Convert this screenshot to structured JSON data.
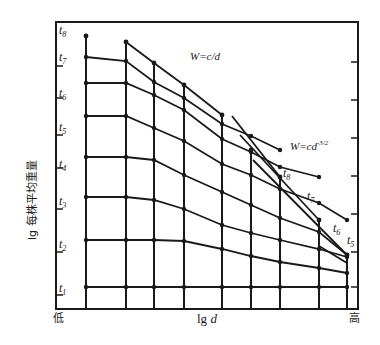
{
  "chart_data": {
    "type": "line",
    "title": "",
    "xlabel": "lg d",
    "ylabel": "lg 每株平均重量",
    "x_axis_ends": {
      "low": "低",
      "high": "高"
    },
    "grid": false,
    "legend": null,
    "annotations": [
      {
        "text": "W=c/d",
        "position": "upper-middle"
      },
      {
        "text": "W=cd^-3/2",
        "display_base": "W=cd",
        "display_exp": "-3/2",
        "position": "right-middle"
      }
    ],
    "y_tick_labels": [
      "t1",
      "t2",
      "t3",
      "t4",
      "t5",
      "t6",
      "t7",
      "t8"
    ],
    "density_positions_px": [
      86,
      126,
      154,
      184,
      222,
      251,
      280,
      319,
      347
    ],
    "density_column_tops_px": [
      36,
      42,
      63,
      85,
      115,
      150,
      177,
      220,
      255
    ],
    "series": [
      {
        "name": "t1",
        "values_px": [
          287,
          287,
          287,
          287,
          287,
          287,
          287,
          287,
          287
        ]
      },
      {
        "name": "t2",
        "values_px": [
          240,
          240,
          240,
          241,
          249,
          256,
          262,
          268,
          273
        ]
      },
      {
        "name": "t3",
        "values_px": [
          197,
          197,
          200,
          209,
          225,
          233,
          240,
          249,
          257
        ]
      },
      {
        "name": "t4",
        "values_px": [
          157,
          157,
          160,
          175,
          192,
          205,
          218,
          232,
          255
        ]
      },
      {
        "name": "t5",
        "values_px": [
          116,
          116,
          128,
          141,
          164,
          175,
          189,
          203,
          220
        ]
      },
      {
        "name": "t6",
        "values_px": [
          83,
          83,
          95,
          110,
          139,
          152,
          167,
          177
        ]
      },
      {
        "name": "t7",
        "values_px": [
          57,
          61,
          82,
          98,
          124,
          136,
          150
        ]
      },
      {
        "name": "t8",
        "values_px": [
          36
        ]
      }
    ],
    "envelope_wcd": {
      "x_px": [
        126,
        154,
        184,
        222
      ],
      "y_px": [
        42,
        63,
        85,
        115
      ]
    },
    "self_thinning_lines": [
      {
        "label": "t8",
        "x1": 232,
        "y1": 116,
        "x2": 280,
        "y2": 177
      },
      {
        "label": "t7",
        "x1": 240,
        "y1": 135,
        "x2": 319,
        "y2": 220
      },
      {
        "label": "t6",
        "x1": 253,
        "y1": 160,
        "x2": 347,
        "y2": 255
      },
      {
        "label": "t5",
        "x1": 319,
        "y1": 246,
        "x2": 347,
        "y2": 263
      }
    ],
    "right_axis_ticks_px": [
      62,
      100,
      138,
      176,
      214,
      252,
      287
    ]
  },
  "labels": {
    "y_ticks": [
      {
        "base": "t",
        "sub": "1",
        "y": 287
      },
      {
        "base": "t",
        "sub": "2",
        "y": 244
      },
      {
        "base": "t",
        "sub": "3",
        "y": 201
      },
      {
        "base": "t",
        "sub": "4",
        "y": 160
      },
      {
        "base": "t",
        "sub": "5",
        "y": 127
      },
      {
        "base": "t",
        "sub": "6",
        "y": 90
      },
      {
        "base": "t",
        "sub": "7",
        "y": 58
      },
      {
        "base": "t",
        "sub": "8",
        "y": 32
      }
    ],
    "eq1": "W=c/d",
    "eq2_base": "W=cd",
    "eq2_exp": "-3/2",
    "thinning_labels": [
      {
        "base": "t",
        "sub": "8"
      },
      {
        "base": "t",
        "sub": "7"
      },
      {
        "base": "t",
        "sub": "6"
      },
      {
        "base": "t",
        "sub": "5"
      }
    ],
    "x_low": "低",
    "x_high": "高",
    "x_axis_title_a": "lg ",
    "x_axis_title_b": "d",
    "y_axis_title": "lg 每株平均重量"
  }
}
